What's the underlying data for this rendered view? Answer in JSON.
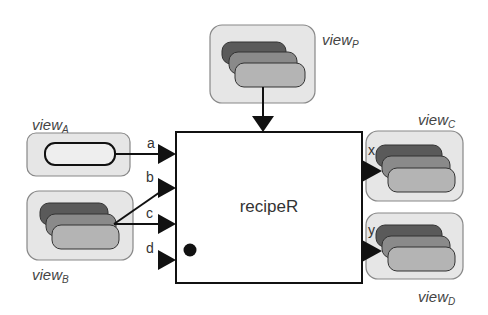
{
  "diagram": {
    "type": "block-diagram",
    "main_block": {
      "label": "recipeR",
      "has_state_dot": true
    },
    "views": [
      {
        "id": "A",
        "label_base": "view",
        "label_sub": "A",
        "kind": "single",
        "position": "left-top"
      },
      {
        "id": "B",
        "label_base": "view",
        "label_sub": "B",
        "kind": "stack",
        "position": "left-bottom"
      },
      {
        "id": "P",
        "label_base": "view",
        "label_sub": "P",
        "kind": "stack",
        "position": "top"
      },
      {
        "id": "C",
        "label_base": "view",
        "label_sub": "C",
        "kind": "stack",
        "position": "right-top"
      },
      {
        "id": "D",
        "label_base": "view",
        "label_sub": "D",
        "kind": "stack",
        "position": "right-bottom"
      }
    ],
    "input_ports": [
      {
        "name": "a",
        "source": "viewA"
      },
      {
        "name": "b",
        "source": "viewB"
      },
      {
        "name": "c",
        "source": "viewB"
      },
      {
        "name": "d",
        "source": ""
      }
    ],
    "output_ports": [
      {
        "name": "x",
        "target": "viewC"
      },
      {
        "name": "y",
        "target": "viewD"
      }
    ],
    "top_input": {
      "source": "viewP"
    }
  },
  "colors": {
    "view_bg": "#e6e6e6",
    "view_border": "#888888",
    "stack_dark": "#5a5a5a",
    "stack_mid": "#8a8a8a",
    "stack_light": "#b4b4b4",
    "stroke": "#111111"
  }
}
